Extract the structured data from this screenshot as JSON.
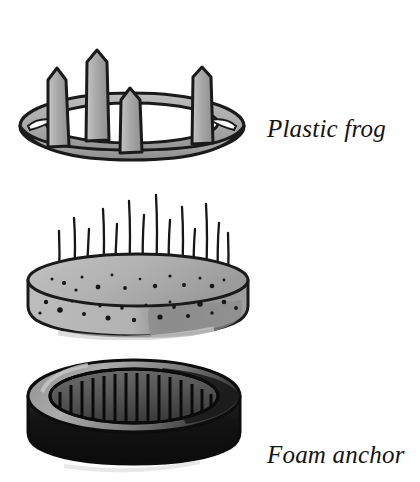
{
  "page": {
    "background_color": "#fefefe",
    "width": 420,
    "height": 482,
    "ink_color": "#141414",
    "illustration_style": "hand-drawn pen-and-ink with gray wash"
  },
  "figures": [
    {
      "id": "plastic-frog",
      "caption": "Plastic frog",
      "description": "Oval plastic ring with four tall tapered spikes rising from the rim",
      "spike_count": 4,
      "colors": {
        "outline": "#1a1a1a",
        "fill": "#a9a9a9",
        "fill_shadow": "#8d8d8d",
        "highlight": "#c9c9c9"
      }
    },
    {
      "id": "foam-anchor",
      "caption": "Foam anchor",
      "description": "Speckled cylindrical foam disc pierced by a bed of thin upright pins",
      "pin_count": 14,
      "colors": {
        "outline": "#1a1a1a",
        "fill": "#b4b4b4",
        "fill_shadow": "#8e8e8e",
        "speckle": "#161616"
      }
    },
    {
      "id": "well-pinholder",
      "caption": "Well pinholder",
      "description": "Dark heavy oval well with a raised rim and a bed of closely spaced needles inside",
      "needle_count": 16,
      "colors": {
        "outline": "#0d0d0d",
        "body": "#111111",
        "rim": "#9a9a9a",
        "well_floor": "#5a5a5a",
        "needle": "#0a0a0a"
      }
    }
  ]
}
